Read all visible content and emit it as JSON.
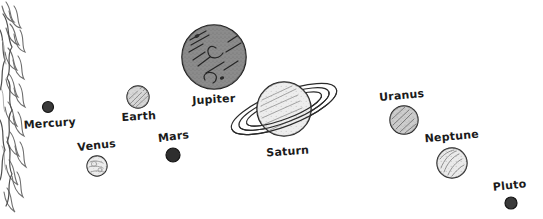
{
  "scene": {
    "title": "Solar System Hand-Drawn Sketch",
    "width": 543,
    "height": 219,
    "background_color": "#ffffff",
    "ink_color": "#1b1b1b",
    "style": "hand-drawn pencil sketch, white background, single horizontal row of planets"
  },
  "sun": {
    "name": "sun",
    "label": "",
    "description": "Partial sun at far-left edge, only its right limb visible with wavy flame-like corona rays",
    "color": "#ffffff",
    "outline_color": "#5a5a5a",
    "cx": -10,
    "cy": 100,
    "extends_to_x": 32
  },
  "planets": [
    {
      "id": "mercury",
      "label": "Mercury",
      "cx": 48,
      "cy": 107,
      "r": 5.5,
      "fill": "#3a3a3a",
      "stroke": "#151515",
      "label_x": 50,
      "label_y": 127,
      "label_anchor": "middle",
      "label_rotate": -4,
      "texture": "solid-dark",
      "has_rings": false
    },
    {
      "id": "venus",
      "label": "Venus",
      "cx": 97,
      "cy": 166,
      "r": 10,
      "fill": "#d8d8d8",
      "stroke": "#1b1b1b",
      "label_x": 97,
      "label_y": 149,
      "label_anchor": "middle",
      "label_rotate": -6,
      "texture": "mottled-light",
      "has_rings": false
    },
    {
      "id": "earth",
      "label": "Earth",
      "cx": 138,
      "cy": 97,
      "r": 11,
      "fill": "#b9b9b9",
      "stroke": "#1b1b1b",
      "label_x": 139,
      "label_y": 120,
      "label_anchor": "middle",
      "label_rotate": -3,
      "texture": "diagonal-shade",
      "has_rings": false
    },
    {
      "id": "mars",
      "label": "Mars",
      "cx": 173,
      "cy": 155,
      "r": 7,
      "fill": "#2e2e2e",
      "stroke": "#141414",
      "label_x": 174,
      "label_y": 140,
      "label_anchor": "middle",
      "label_rotate": -7,
      "texture": "solid-dark",
      "has_rings": false
    },
    {
      "id": "jupiter",
      "label": "Jupiter",
      "cx": 214,
      "cy": 57,
      "r": 32,
      "fill": "#5e5e5e",
      "stroke": "#1b1b1b",
      "label_x": 214,
      "label_y": 103,
      "label_anchor": "middle",
      "label_rotate": -3,
      "texture": "dark-bands",
      "has_rings": false
    },
    {
      "id": "saturn",
      "label": "Saturn",
      "cx": 284,
      "cy": 109,
      "r": 27,
      "fill": "#e0e0e0",
      "stroke": "#1b1b1b",
      "label_x": 288,
      "label_y": 155,
      "label_anchor": "middle",
      "label_rotate": -4,
      "texture": "light-bands",
      "has_rings": true,
      "ring_rx": 56,
      "ring_ry": 17,
      "ring_rotate": -21
    },
    {
      "id": "uranus",
      "label": "Uranus",
      "cx": 404,
      "cy": 120,
      "r": 14,
      "fill": "#acacac",
      "stroke": "#1b1b1b",
      "label_x": 402,
      "label_y": 99,
      "label_anchor": "middle",
      "label_rotate": -5,
      "texture": "diagonal-hatch",
      "has_rings": false
    },
    {
      "id": "neptune",
      "label": "Neptune",
      "cx": 452,
      "cy": 163,
      "r": 15,
      "fill": "#dcdcdc",
      "stroke": "#1b1b1b",
      "label_x": 452,
      "label_y": 140,
      "label_anchor": "middle",
      "label_rotate": -5,
      "texture": "curved-shade",
      "has_rings": false
    },
    {
      "id": "pluto",
      "label": "Pluto",
      "cx": 511,
      "cy": 203,
      "r": 6,
      "fill": "#3a3a3a",
      "stroke": "#151515",
      "label_x": 510,
      "label_y": 189,
      "label_anchor": "middle",
      "label_rotate": -6,
      "texture": "solid-dark",
      "has_rings": false
    }
  ]
}
